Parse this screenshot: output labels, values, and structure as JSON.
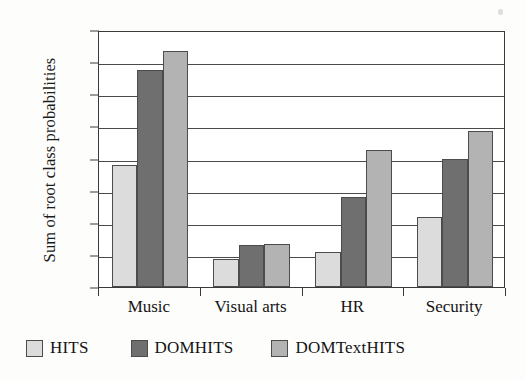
{
  "chart_data": {
    "type": "bar",
    "title": "",
    "xlabel": "",
    "ylabel": "Sum of root class probabilities",
    "categories": [
      "Music",
      "Visual arts",
      "HR",
      "Security"
    ],
    "series": [
      {
        "name": "HITS",
        "color": "#dcdcdc",
        "values": [
          19.0,
          4.3,
          5.4,
          10.9
        ]
      },
      {
        "name": "DOMHITS",
        "color": "#6f6f6f",
        "values": [
          33.7,
          6.6,
          14.0,
          20.0
        ]
      },
      {
        "name": "DOMTextHITS",
        "color": "#b3b3b3",
        "values": [
          36.7,
          6.7,
          21.3,
          24.3
        ]
      }
    ],
    "ylim": [
      0,
      40
    ],
    "yticks": [
      0,
      5,
      10,
      15,
      20,
      25,
      30,
      35,
      40
    ],
    "ytick_labels": [
      "0",
      "5",
      "10",
      "15",
      "20",
      "25",
      "30",
      "35",
      "40"
    ],
    "grid": true,
    "legend_position": "below",
    "legend_entries": [
      "HITS",
      "DOMHITS",
      "DOMTextHITS"
    ]
  }
}
